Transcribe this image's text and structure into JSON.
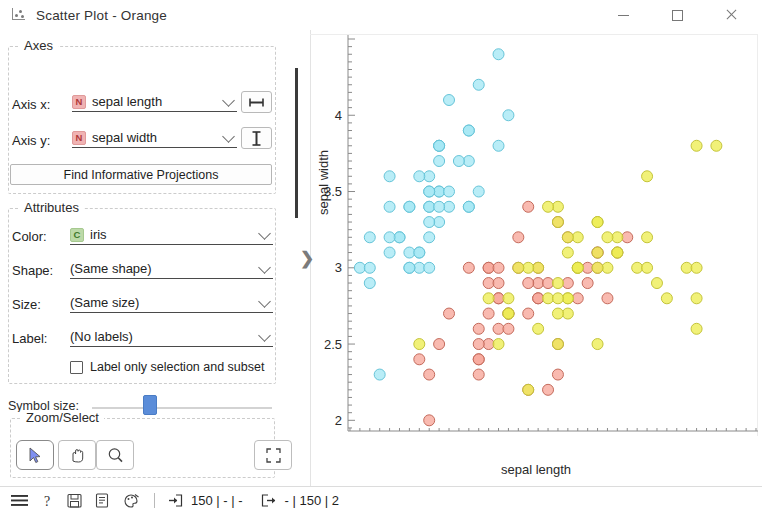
{
  "window": {
    "title": "Scatter Plot - Orange",
    "icon": "scatter-plot-icon",
    "minimize_label": "—",
    "maximize_label": "□",
    "close_label": "✕"
  },
  "panel": {
    "axes": {
      "title": "Axes",
      "axis_x_label": "Axis x:",
      "axis_x_value": "sepal length",
      "axis_x_vartype": "N",
      "axis_y_label": "Axis y:",
      "axis_y_value": "sepal width",
      "axis_y_vartype": "N",
      "axis_x_button": "horizontal-extent-icon",
      "axis_y_button": "vertical-extent-icon",
      "find_projections_label": "Find Informative Projections"
    },
    "attributes": {
      "title": "Attributes",
      "color_label": "Color:",
      "color_value": "iris",
      "color_vartype": "C",
      "shape_label": "Shape:",
      "shape_value": "(Same shape)",
      "size_label": "Size:",
      "size_value": "(Same size)",
      "label_label": "Label:",
      "label_value": "(No labels)",
      "label_only_selection": "Label only selection and subset"
    },
    "symbol_size": {
      "label": "Symbol size:",
      "value": 28
    },
    "zoom_select": {
      "title": "Zoom/Select",
      "tools": [
        {
          "name": "select",
          "icon": "cursor-arrow-icon",
          "active": true
        },
        {
          "name": "pan",
          "icon": "hand-icon",
          "active": false
        },
        {
          "name": "zoom",
          "icon": "magnifier-icon",
          "active": false
        },
        {
          "name": "reset-zoom",
          "icon": "fit-to-screen-icon",
          "active": false
        }
      ]
    },
    "send_automatically": {
      "label": "Send Automatically",
      "checked": true
    }
  },
  "statusbar": {
    "menu_icon": "hamburger-menu-icon",
    "help_icon": "question-mark-icon",
    "save_icon": "floppy-disk-icon",
    "report_icon": "document-icon",
    "palette_icon": "color-palette-icon",
    "input_icon": "input-arrow-icon",
    "input_text": "150 | - | -",
    "output_icon": "output-arrow-icon",
    "output_text": "- | 150 | 2"
  },
  "chart_data": {
    "type": "scatter",
    "title": "",
    "xlabel": "sepal length",
    "ylabel": "sepal width",
    "xlim": [
      4.18,
      8.3
    ],
    "ylim": [
      1.93,
      4.5
    ],
    "xticks": [
      4.5,
      5,
      5.5,
      6,
      6.5,
      7,
      7.5
    ],
    "yticks": [
      2,
      2.5,
      3,
      3.5,
      4
    ],
    "grid": false,
    "legend": false,
    "marker": "circle",
    "marker_size": 11,
    "series": [
      {
        "name": "Iris-setosa",
        "color": "#a5e8f5",
        "edge": "#66c4d8",
        "points": [
          [
            5.1,
            3.5
          ],
          [
            4.9,
            3.0
          ],
          [
            4.7,
            3.2
          ],
          [
            4.6,
            3.1
          ],
          [
            5.0,
            3.6
          ],
          [
            5.4,
            3.9
          ],
          [
            4.6,
            3.4
          ],
          [
            5.0,
            3.4
          ],
          [
            4.4,
            2.9
          ],
          [
            4.9,
            3.1
          ],
          [
            5.4,
            3.7
          ],
          [
            4.8,
            3.4
          ],
          [
            4.8,
            3.0
          ],
          [
            4.3,
            3.0
          ],
          [
            5.8,
            4.0
          ],
          [
            5.7,
            4.4
          ],
          [
            5.4,
            3.9
          ],
          [
            5.1,
            3.5
          ],
          [
            5.7,
            3.8
          ],
          [
            5.1,
            3.8
          ],
          [
            5.4,
            3.4
          ],
          [
            5.1,
            3.7
          ],
          [
            4.6,
            3.6
          ],
          [
            5.1,
            3.3
          ],
          [
            4.8,
            3.4
          ],
          [
            5.0,
            3.0
          ],
          [
            5.0,
            3.4
          ],
          [
            5.2,
            3.5
          ],
          [
            5.2,
            3.4
          ],
          [
            4.7,
            3.2
          ],
          [
            4.8,
            3.1
          ],
          [
            5.4,
            3.4
          ],
          [
            5.2,
            4.1
          ],
          [
            5.5,
            4.2
          ],
          [
            4.9,
            3.1
          ],
          [
            5.0,
            3.2
          ],
          [
            5.5,
            3.5
          ],
          [
            4.9,
            3.6
          ],
          [
            4.4,
            3.0
          ],
          [
            5.1,
            3.4
          ],
          [
            5.0,
            3.5
          ],
          [
            4.5,
            2.3
          ],
          [
            4.4,
            3.2
          ],
          [
            5.0,
            3.5
          ],
          [
            5.1,
            3.8
          ],
          [
            4.8,
            3.0
          ],
          [
            5.1,
            3.8
          ],
          [
            4.6,
            3.2
          ],
          [
            5.3,
            3.7
          ],
          [
            5.0,
            3.3
          ]
        ]
      },
      {
        "name": "Iris-versicolor",
        "color": "#f7a79a",
        "edge": "#c46b5c",
        "points": [
          [
            7.0,
            3.2
          ],
          [
            6.4,
            3.2
          ],
          [
            6.9,
            3.1
          ],
          [
            5.5,
            2.3
          ],
          [
            6.5,
            2.8
          ],
          [
            5.7,
            2.8
          ],
          [
            6.3,
            3.3
          ],
          [
            4.9,
            2.4
          ],
          [
            6.6,
            2.9
          ],
          [
            5.2,
            2.7
          ],
          [
            5.0,
            2.0
          ],
          [
            5.9,
            3.0
          ],
          [
            6.0,
            2.2
          ],
          [
            6.1,
            2.9
          ],
          [
            5.6,
            2.9
          ],
          [
            6.7,
            3.1
          ],
          [
            5.6,
            3.0
          ],
          [
            5.8,
            2.7
          ],
          [
            6.2,
            2.2
          ],
          [
            5.6,
            2.5
          ],
          [
            5.9,
            3.2
          ],
          [
            6.1,
            2.8
          ],
          [
            6.3,
            2.5
          ],
          [
            6.1,
            2.8
          ],
          [
            6.4,
            2.9
          ],
          [
            6.6,
            3.0
          ],
          [
            6.8,
            2.8
          ],
          [
            6.7,
            3.0
          ],
          [
            6.0,
            2.9
          ],
          [
            5.7,
            2.6
          ],
          [
            5.5,
            2.4
          ],
          [
            5.5,
            2.4
          ],
          [
            5.8,
            2.7
          ],
          [
            6.0,
            2.7
          ],
          [
            5.4,
            3.0
          ],
          [
            6.0,
            3.4
          ],
          [
            6.7,
            3.1
          ],
          [
            6.3,
            2.3
          ],
          [
            5.6,
            3.0
          ],
          [
            5.5,
            2.5
          ],
          [
            5.5,
            2.6
          ],
          [
            6.1,
            3.0
          ],
          [
            5.8,
            2.6
          ],
          [
            5.0,
            2.3
          ],
          [
            5.6,
            2.7
          ],
          [
            5.7,
            3.0
          ],
          [
            5.7,
            2.9
          ],
          [
            6.2,
            2.9
          ],
          [
            5.1,
            2.5
          ],
          [
            5.7,
            2.8
          ]
        ]
      },
      {
        "name": "Iris-virginica",
        "color": "#eded52",
        "edge": "#c4c43a",
        "points": [
          [
            6.3,
            3.3
          ],
          [
            5.8,
            2.7
          ],
          [
            7.1,
            3.0
          ],
          [
            6.3,
            2.9
          ],
          [
            6.5,
            3.0
          ],
          [
            7.6,
            3.0
          ],
          [
            4.9,
            2.5
          ],
          [
            7.3,
            2.9
          ],
          [
            6.7,
            2.5
          ],
          [
            7.2,
            3.6
          ],
          [
            6.5,
            3.2
          ],
          [
            6.4,
            2.7
          ],
          [
            6.8,
            3.0
          ],
          [
            5.7,
            2.5
          ],
          [
            5.8,
            2.8
          ],
          [
            6.4,
            3.2
          ],
          [
            6.5,
            3.0
          ],
          [
            7.7,
            3.8
          ],
          [
            7.7,
            2.6
          ],
          [
            6.0,
            2.2
          ],
          [
            6.9,
            3.2
          ],
          [
            5.6,
            2.8
          ],
          [
            7.7,
            2.8
          ],
          [
            6.3,
            2.7
          ],
          [
            6.7,
            3.3
          ],
          [
            7.2,
            3.2
          ],
          [
            6.2,
            2.8
          ],
          [
            6.1,
            3.0
          ],
          [
            6.4,
            2.8
          ],
          [
            7.2,
            3.0
          ],
          [
            7.4,
            2.8
          ],
          [
            7.9,
            3.8
          ],
          [
            6.4,
            2.8
          ],
          [
            6.3,
            2.8
          ],
          [
            6.1,
            2.6
          ],
          [
            7.7,
            3.0
          ],
          [
            6.3,
            3.4
          ],
          [
            6.4,
            3.1
          ],
          [
            6.0,
            3.0
          ],
          [
            6.9,
            3.1
          ],
          [
            6.7,
            3.1
          ],
          [
            6.9,
            3.1
          ],
          [
            5.8,
            2.7
          ],
          [
            6.8,
            3.2
          ],
          [
            6.7,
            3.3
          ],
          [
            6.7,
            3.0
          ],
          [
            6.3,
            2.5
          ],
          [
            6.5,
            3.0
          ],
          [
            6.2,
            3.4
          ],
          [
            5.9,
            3.0
          ]
        ]
      }
    ]
  }
}
